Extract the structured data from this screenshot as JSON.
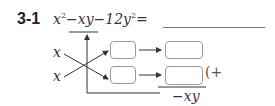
{
  "problem": {
    "number": "3-1",
    "expression": {
      "term1": "x",
      "term1_exp": "2",
      "op1": "−",
      "term2": "xy",
      "op2": "−",
      "term3": "12y",
      "term3_exp": "2",
      "equals": "="
    },
    "answer_blank": ""
  },
  "cross_diagram": {
    "left_factors": [
      "x",
      "x"
    ],
    "small_boxes": [
      "",
      ""
    ],
    "result_boxes": [
      "",
      ""
    ],
    "sum_prefix": "(+",
    "sum_result": "−xy"
  }
}
